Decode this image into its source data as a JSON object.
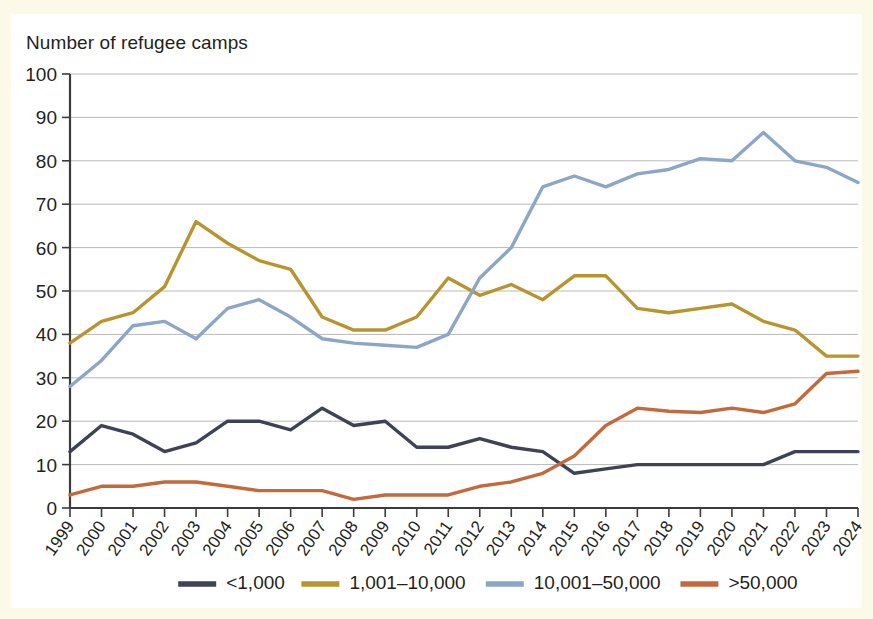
{
  "figure": {
    "title": "Number of refugee camps",
    "background": "#fdf9e8",
    "panel_background": "#ffffff"
  },
  "chart_data": {
    "type": "line",
    "title": "Number of refugee camps",
    "xlabel": "",
    "ylabel": "Number of refugee camps",
    "ylim": [
      0,
      100
    ],
    "ytick_values": [
      0,
      10,
      20,
      30,
      40,
      50,
      60,
      70,
      80,
      90,
      100
    ],
    "ytick_labels": [
      "0",
      "10",
      "20",
      "30",
      "40",
      "50",
      "60",
      "70",
      "80",
      "90",
      "100"
    ],
    "grid": true,
    "grid_axis": "y",
    "legend_position": "bottom",
    "categories": [
      "1999",
      "2000",
      "2001",
      "2002",
      "2003",
      "2004",
      "2005",
      "2006",
      "2007",
      "2008",
      "2009",
      "2010",
      "2011",
      "2012",
      "2013",
      "2014",
      "2015",
      "2016",
      "2017",
      "2018",
      "2019",
      "2020",
      "2021",
      "2022",
      "2023",
      "2024"
    ],
    "series": [
      {
        "name": "<1,000",
        "color": "#3d4257",
        "values": [
          13,
          19,
          17,
          13,
          15,
          20,
          20,
          18,
          23,
          19,
          20,
          14,
          14,
          16,
          14,
          13,
          8,
          9,
          10,
          10,
          10,
          10,
          10,
          13,
          13,
          13
        ]
      },
      {
        "name": "1,001–10,000",
        "color": "#b8942f",
        "values": [
          38,
          43,
          45,
          51,
          66,
          61,
          57,
          55,
          44,
          41,
          41,
          44,
          53,
          49,
          51.5,
          48,
          53.5,
          53.5,
          46,
          45,
          46,
          47,
          43,
          41,
          35,
          35
        ]
      },
      {
        "name": "10,001–50,000",
        "color": "#8ba6c6",
        "values": [
          28,
          34,
          42,
          43,
          39,
          46,
          48,
          44,
          39,
          38,
          37.5,
          37,
          40,
          53,
          60,
          74,
          76.5,
          74,
          77,
          78,
          80.5,
          80,
          86.5,
          80,
          78.5,
          75
        ]
      },
      {
        "name": ">50,000",
        "color": "#c3693c",
        "values": [
          3,
          5,
          5,
          6,
          6,
          5,
          4,
          4,
          4,
          2,
          3,
          3,
          3,
          5,
          6,
          8,
          12,
          19,
          23,
          22.3,
          22,
          23,
          22,
          24,
          31,
          31.5
        ]
      }
    ]
  },
  "legend": {
    "items": [
      {
        "label": "<1,000",
        "color": "#3d4257"
      },
      {
        "label": "1,001–10,000",
        "color": "#b8942f"
      },
      {
        "label": "10,001–50,000",
        "color": "#8ba6c6"
      },
      {
        "label": ">50,000",
        "color": "#c3693c"
      }
    ]
  }
}
